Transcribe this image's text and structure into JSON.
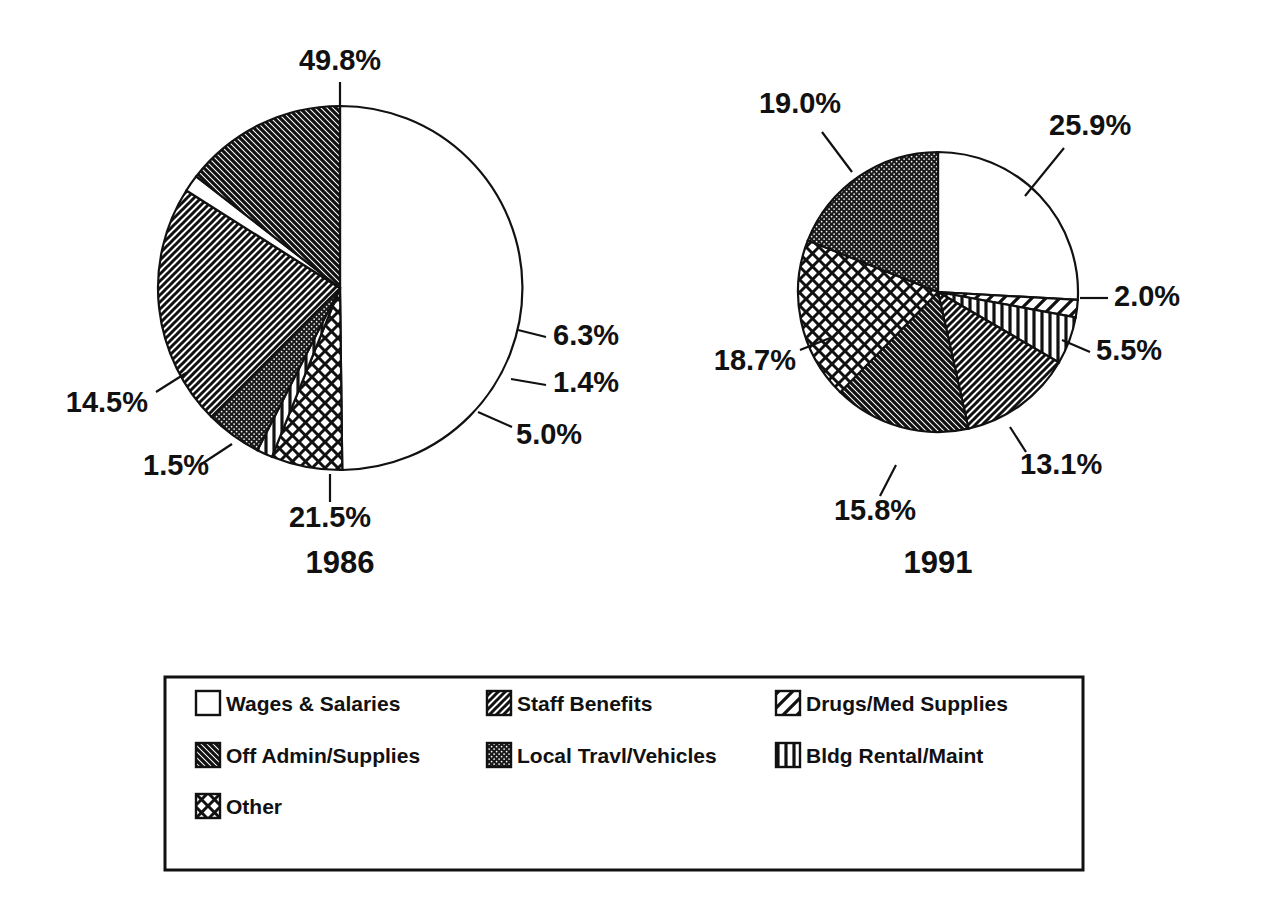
{
  "chart_data": [
    {
      "type": "pie",
      "title": "1986",
      "categories": [
        "Wages & Salaries",
        "Other",
        "Bldg Rental/Maint",
        "Local Travl/Vehicles",
        "Staff Benefits",
        "Drugs/Med Supplies",
        "Off Admin/Supplies"
      ],
      "values": [
        49.8,
        6.3,
        1.4,
        5.0,
        21.5,
        1.5,
        14.5
      ],
      "labels": [
        "49.8%",
        "6.3%",
        "1.4%",
        "5.0%",
        "21.5%",
        "1.5%",
        "14.5%"
      ],
      "units": "percent",
      "legend_position": "bottom",
      "grid": false
    },
    {
      "type": "pie",
      "title": "1991",
      "categories": [
        "Wages & Salaries",
        "Drugs/Med Supplies",
        "Bldg Rental/Maint",
        "Staff Benefits",
        "Off Admin/Supplies",
        "Other",
        "Local Travl/Vehicles"
      ],
      "values": [
        25.9,
        2.0,
        5.5,
        13.1,
        15.8,
        18.7,
        19.0
      ],
      "labels": [
        "25.9%",
        "2.0%",
        "5.5%",
        "13.1%",
        "15.8%",
        "18.7%",
        "19.0%"
      ],
      "units": "percent",
      "legend_position": "bottom",
      "grid": false
    }
  ],
  "pies": [
    {
      "id": "pie-1986",
      "year_label": "1986",
      "cx": 340,
      "cy": 288,
      "r": 182,
      "year_x": 340,
      "year_y": 573,
      "start_angle": -90,
      "slices": [
        {
          "key": "wages",
          "value": 49.8,
          "label": "49.8%",
          "pattern": "solid-white",
          "label_x": 340,
          "label_y": 70,
          "anchor": "middle",
          "leader": [
            [
              340,
              82
            ],
            [
              340,
              106
            ]
          ]
        },
        {
          "key": "other",
          "value": 6.3,
          "label": "6.3%",
          "pattern": "crosshatch",
          "label_x": 553,
          "label_y": 345,
          "anchor": "start",
          "leader": [
            [
              518,
              330
            ],
            [
              546,
              337
            ]
          ]
        },
        {
          "key": "bldg",
          "value": 1.4,
          "label": "1.4%",
          "pattern": "vertical",
          "label_x": 553,
          "label_y": 392,
          "anchor": "start",
          "leader": [
            [
              511,
              379
            ],
            [
              546,
              385
            ]
          ]
        },
        {
          "key": "travel",
          "value": 5.0,
          "label": "5.0%",
          "pattern": "dark-dot",
          "label_x": 516,
          "label_y": 444,
          "anchor": "start",
          "leader": [
            [
              478,
              412
            ],
            [
              512,
              427
            ]
          ]
        },
        {
          "key": "benefits",
          "value": 21.5,
          "label": "21.5%",
          "pattern": "fwd-hatch",
          "label_x": 330,
          "label_y": 527,
          "anchor": "middle",
          "leader": [
            [
              330,
              474
            ],
            [
              330,
              502
            ]
          ]
        },
        {
          "key": "drugs",
          "value": 1.5,
          "label": "1.5%",
          "pattern": "solid-white",
          "label_x": 143,
          "label_y": 475,
          "anchor": "start",
          "leader": [
            [
              232,
              444
            ],
            [
              200,
              465
            ]
          ]
        },
        {
          "key": "offadmin",
          "value": 14.5,
          "label": "14.5%",
          "pattern": "back-hatch",
          "label_x": 148,
          "label_y": 412,
          "anchor": "end",
          "leader": [
            [
              186,
              373
            ],
            [
              156,
              392
            ]
          ]
        }
      ]
    },
    {
      "id": "pie-1991",
      "year_label": "1991",
      "cx": 938,
      "cy": 292,
      "r": 140,
      "year_x": 938,
      "year_y": 573,
      "start_angle": -90,
      "slices": [
        {
          "key": "wages",
          "value": 25.9,
          "label": "25.9%",
          "pattern": "solid-white",
          "label_x": 1049,
          "label_y": 135,
          "anchor": "start",
          "leader": [
            [
              1025,
              196
            ],
            [
              1064,
              148
            ]
          ]
        },
        {
          "key": "drugs",
          "value": 2.0,
          "label": "2.0%",
          "pattern": "wide-diag",
          "label_x": 1114,
          "label_y": 306,
          "anchor": "start",
          "leader": [
            [
              1080,
              298
            ],
            [
              1108,
              298
            ]
          ]
        },
        {
          "key": "bldg",
          "value": 5.5,
          "label": "5.5%",
          "pattern": "vertical",
          "label_x": 1096,
          "label_y": 360,
          "anchor": "start",
          "leader": [
            [
              1062,
              340
            ],
            [
              1090,
              352
            ]
          ]
        },
        {
          "key": "benefits",
          "value": 13.1,
          "label": "13.1%",
          "pattern": "fwd-hatch",
          "label_x": 1020,
          "label_y": 474,
          "anchor": "start",
          "leader": [
            [
              1010,
              427
            ],
            [
              1026,
              452
            ]
          ]
        },
        {
          "key": "offadmin",
          "value": 15.8,
          "label": "15.8%",
          "pattern": "back-hatch",
          "label_x": 875,
          "label_y": 520,
          "anchor": "middle",
          "leader": [
            [
              896,
              465
            ],
            [
              880,
              496
            ]
          ]
        },
        {
          "key": "other",
          "value": 18.7,
          "label": "18.7%",
          "pattern": "crosshatch",
          "label_x": 796,
          "label_y": 370,
          "anchor": "end",
          "leader": [
            [
              830,
              338
            ],
            [
              800,
              350
            ]
          ]
        },
        {
          "key": "travel",
          "value": 19.0,
          "label": "19.0%",
          "pattern": "dark-dot",
          "label_x": 800,
          "label_y": 113,
          "anchor": "middle",
          "leader": [
            [
              852,
              172
            ],
            [
              822,
              132
            ]
          ]
        }
      ]
    }
  ],
  "legend": {
    "box": {
      "x": 165,
      "y": 677,
      "width": 918,
      "height": 193
    },
    "columns_x": [
      196,
      487,
      776
    ],
    "rows_y": [
      711,
      763,
      814
    ],
    "swatch_size": 24,
    "items": [
      {
        "label": "Wages & Salaries",
        "pattern": "solid-white",
        "col": 0,
        "row": 0
      },
      {
        "label": "Staff Benefits",
        "pattern": "fwd-hatch",
        "col": 1,
        "row": 0
      },
      {
        "label": "Drugs/Med Supplies",
        "pattern": "wide-diag",
        "col": 2,
        "row": 0
      },
      {
        "label": "Off Admin/Supplies",
        "pattern": "back-hatch",
        "col": 0,
        "row": 1
      },
      {
        "label": "Local Travl/Vehicles",
        "pattern": "dark-dot",
        "col": 1,
        "row": 1
      },
      {
        "label": "Bldg Rental/Maint",
        "pattern": "vertical",
        "col": 2,
        "row": 1
      },
      {
        "label": "Other",
        "pattern": "crosshatch",
        "col": 0,
        "row": 2
      }
    ]
  },
  "colors": {
    "ink": "#111111",
    "background": "#ffffff"
  }
}
